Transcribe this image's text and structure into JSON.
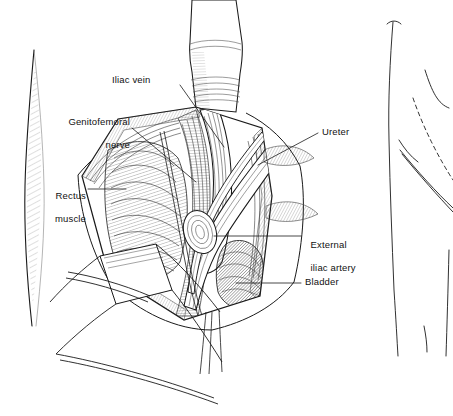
{
  "figure": {
    "background_color": "#ffffff",
    "ink_color": "#1a1a1a",
    "views": [
      {
        "name": "main-surgical-field",
        "description": "Opened lower-abdominal incision with retractors exposing iliac vessels, ureter and bladder"
      },
      {
        "name": "orientation-inset",
        "description": "Small body outline at right showing dashed incision site over the hip"
      }
    ]
  },
  "labels": [
    {
      "id": "iliac-vein",
      "text": "Iliac vein",
      "lines": [
        "Iliac vein"
      ],
      "align": "left",
      "x": 112,
      "y": 74,
      "leader": {
        "from": [
          180,
          85
        ],
        "to": [
          224,
          147
        ]
      }
    },
    {
      "id": "genitofemoral-nerve",
      "text": "Genitofemoral nerve",
      "lines": [
        "Genitofemoral",
        "nerve"
      ],
      "align": "right",
      "x": 48,
      "y": 104,
      "leader": {
        "from": [
          132,
          128
        ],
        "to": [
          196,
          182
        ]
      }
    },
    {
      "id": "rectus-muscle",
      "text": "Rectus muscle",
      "lines": [
        "Rectus",
        "muscle"
      ],
      "align": "right",
      "x": 40,
      "y": 178,
      "leader": {
        "from": [
          88,
          189
        ],
        "to": [
          126,
          189
        ]
      }
    },
    {
      "id": "ureter",
      "text": "Ureter",
      "lines": [
        "Ureter"
      ],
      "align": "left",
      "x": 322,
      "y": 126,
      "leader": {
        "from": [
          318,
          133
        ],
        "to": [
          258,
          165
        ]
      }
    },
    {
      "id": "external-iliac-artery",
      "text": "External iliac artery",
      "lines": [
        "External",
        "iliac artery"
      ],
      "align": "left",
      "x": 305,
      "y": 227,
      "leader": {
        "from": [
          301,
          236
        ],
        "to": [
          214,
          236
        ]
      }
    },
    {
      "id": "bladder",
      "text": "Bladder",
      "lines": [
        "Bladder"
      ],
      "align": "left",
      "x": 305,
      "y": 276,
      "leader": {
        "from": [
          301,
          283
        ],
        "to": [
          236,
          283
        ]
      }
    }
  ],
  "inset": {
    "name": "orientation-inset",
    "incision_line_style": "dashed",
    "body_part": "hip and thigh outline"
  }
}
